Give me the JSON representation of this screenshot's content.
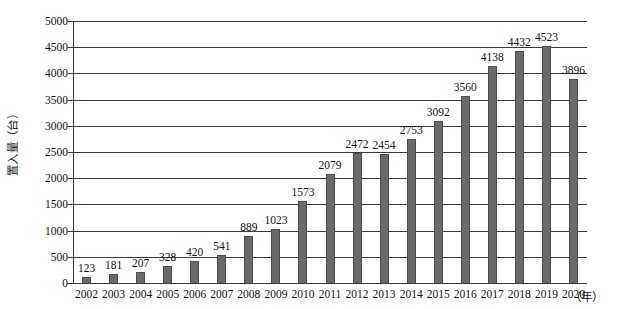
{
  "chart_data": {
    "type": "bar",
    "title": "",
    "xlabel": "（年）",
    "ylabel": "置入量（台）",
    "ylim": [
      0,
      5000
    ],
    "ytick_step": 500,
    "yticks": [
      "0",
      "500",
      "1000",
      "1500",
      "2000",
      "2500",
      "3000",
      "3500",
      "4000",
      "4500",
      "5000"
    ],
    "grid": true,
    "legend": "none",
    "bar_color": "#6a6a6a",
    "axis_color": "#3a3a3a",
    "categories": [
      "2002",
      "2003",
      "2004",
      "2005",
      "2006",
      "2007",
      "2008",
      "2009",
      "2010",
      "2011",
      "2012",
      "2013",
      "2014",
      "2015",
      "2016",
      "2017",
      "2018",
      "2019",
      "2020"
    ],
    "values": [
      123,
      181,
      207,
      328,
      420,
      541,
      889,
      1023,
      1573,
      2079,
      2472,
      2454,
      2753,
      3092,
      3560,
      4138,
      4432,
      4523,
      3896
    ],
    "data_labels": [
      "123",
      "181",
      "207",
      "328",
      "420",
      "541",
      "889",
      "1023",
      "1573",
      "2079",
      "2472",
      "2454",
      "2753",
      "3092",
      "3560",
      "4138",
      "4432",
      "4523",
      "3896"
    ]
  }
}
